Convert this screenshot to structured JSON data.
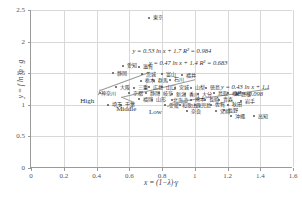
{
  "chart_data": {
    "type": "scatter",
    "title": "",
    "xlabel": "x = (1−λ)·γ",
    "ylabel": "y = f ln m · g",
    "xlim": [
      0,
      1.6
    ],
    "ylim": [
      0,
      2.5
    ],
    "xticks": [
      "0",
      "0.2",
      "0.4",
      "0.6",
      "0.8",
      "1",
      "1.2",
      "1.4",
      "1.6"
    ],
    "xtickvalues": [
      0,
      0.2,
      0.4,
      0.6,
      0.8,
      1,
      1.2,
      1.4,
      1.6
    ],
    "yticks": [
      "0",
      "0.5",
      "1",
      "1.5",
      "2",
      "2.5"
    ],
    "ytickvalues": [
      0,
      0.5,
      1,
      1.5,
      2,
      2.5
    ],
    "grid": true,
    "legend": "none",
    "points": [
      {
        "label": "東京",
        "x": 0.72,
        "y": 2.38
      },
      {
        "label": "愛知",
        "x": 0.56,
        "y": 1.62
      },
      {
        "label": "滋賀",
        "x": 0.66,
        "y": 1.6
      },
      {
        "label": "静岡",
        "x": 0.5,
        "y": 1.5
      },
      {
        "label": "茨城",
        "x": 0.68,
        "y": 1.48
      },
      {
        "label": "富山",
        "x": 0.8,
        "y": 1.48
      },
      {
        "label": "福井",
        "x": 0.92,
        "y": 1.47
      },
      {
        "label": "栃木",
        "x": 0.67,
        "y": 1.38
      },
      {
        "label": "群馬",
        "x": 0.75,
        "y": 1.38
      },
      {
        "label": "石川",
        "x": 0.85,
        "y": 1.4
      },
      {
        "label": "大阪",
        "x": 0.52,
        "y": 1.28
      },
      {
        "label": "三重",
        "x": 0.63,
        "y": 1.27
      },
      {
        "label": "広島",
        "x": 0.72,
        "y": 1.28
      },
      {
        "label": "山口",
        "x": 0.8,
        "y": 1.28
      },
      {
        "label": "宮城",
        "x": 0.88,
        "y": 1.27
      },
      {
        "label": "山梨",
        "x": 0.98,
        "y": 1.27
      },
      {
        "label": "徳島",
        "x": 1.07,
        "y": 1.27
      },
      {
        "label": "神奈川",
        "x": 0.42,
        "y": 1.18
      },
      {
        "label": "京都",
        "x": 0.6,
        "y": 1.18
      },
      {
        "label": "静岡",
        "x": 0.7,
        "y": 1.18
      },
      {
        "label": "岐阜",
        "x": 0.78,
        "y": 1.18
      },
      {
        "label": "新潟",
        "x": 0.86,
        "y": 1.17
      },
      {
        "label": "香川",
        "x": 0.94,
        "y": 1.17
      },
      {
        "label": "大分",
        "x": 1.02,
        "y": 1.17
      },
      {
        "label": "鳥取",
        "x": 1.12,
        "y": 1.18
      },
      {
        "label": "福島",
        "x": 1.2,
        "y": 1.18
      },
      {
        "label": "島根",
        "x": 1.26,
        "y": 1.17
      },
      {
        "label": "福岡",
        "x": 0.66,
        "y": 1.09
      },
      {
        "label": "山形",
        "x": 0.74,
        "y": 1.08
      },
      {
        "label": "北海道",
        "x": 0.86,
        "y": 1.07
      },
      {
        "label": "熊本",
        "x": 0.98,
        "y": 1.08
      },
      {
        "label": "長崎",
        "x": 1.06,
        "y": 1.08
      },
      {
        "label": "青森",
        "x": 1.15,
        "y": 1.08
      },
      {
        "label": "岩手",
        "x": 1.28,
        "y": 1.06
      },
      {
        "label": "埼玉",
        "x": 0.47,
        "y": 1.0
      },
      {
        "label": "千葉",
        "x": 0.55,
        "y": 1.0
      },
      {
        "label": "愛媛",
        "x": 0.82,
        "y": 0.99
      },
      {
        "label": "和歌山",
        "x": 0.91,
        "y": 0.99
      },
      {
        "label": "鹿児島",
        "x": 1.0,
        "y": 0.99
      },
      {
        "label": "佐賀",
        "x": 1.1,
        "y": 1.0
      },
      {
        "label": "秋田",
        "x": 1.2,
        "y": 1.0
      },
      {
        "label": "長野",
        "x": 1.18,
        "y": 0.91
      },
      {
        "label": "奈良",
        "x": 0.95,
        "y": 0.9
      },
      {
        "label": "宮崎",
        "x": 1.13,
        "y": 0.9
      },
      {
        "label": "沖縄",
        "x": 1.22,
        "y": 0.82
      },
      {
        "label": "高知",
        "x": 1.36,
        "y": 0.82
      }
    ],
    "trendlines": [
      {
        "name": "High",
        "equation": "y = 0.53 ln x + 1.7",
        "r2_label": "R² = 0.984",
        "slope": 0.53,
        "intercept": 1.7,
        "r2": 0.984,
        "x_from": 0.42,
        "x_to": 0.72
      },
      {
        "name": "Middle",
        "equation": "y = 0.47 ln x + 1.4",
        "r2_label": "R² = 0.683",
        "slope": 0.47,
        "intercept": 1.4,
        "r2": 0.683,
        "x_from": 0.55,
        "x_to": 1.0
      },
      {
        "name": "Low",
        "equation": "y = 0.43 ln x + 1.1",
        "r2_label": "R² = 0.098",
        "slope": 0.43,
        "intercept": 1.1,
        "r2": 0.098,
        "x_from": 0.95,
        "x_to": 1.45
      }
    ],
    "annotations": [
      {
        "text": "High",
        "x": 0.3,
        "y": 1.12
      },
      {
        "text": "Middle",
        "x": 0.52,
        "y": 1.0
      },
      {
        "text": "Low",
        "x": 0.72,
        "y": 0.95
      }
    ]
  }
}
